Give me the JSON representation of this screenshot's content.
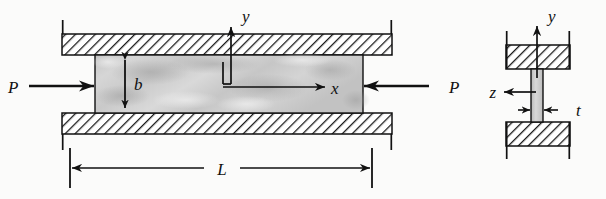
{
  "figure": {
    "colors": {
      "line": "#111111",
      "hatch": "#1a1a1a",
      "specimen_fill": "#cfcfcf",
      "background": "#fbfbfa"
    },
    "side_view": {
      "load_left": {
        "label": "P",
        "arrow_direction": "right"
      },
      "load_right": {
        "label": "P",
        "arrow_direction": "left"
      },
      "axes": {
        "vertical": {
          "label": "y",
          "direction": "up"
        },
        "horizontal": {
          "label": "x",
          "direction": "right"
        }
      },
      "dimensions": [
        {
          "label": "b",
          "orientation": "vertical",
          "description": "plate depth"
        },
        {
          "label": "L",
          "orientation": "horizontal",
          "description": "plate length"
        }
      ],
      "supports": [
        {
          "name": "upper-support",
          "style": "hatched"
        },
        {
          "name": "lower-support",
          "style": "hatched"
        }
      ]
    },
    "cross_section": {
      "axes": {
        "vertical": {
          "label": "y",
          "direction": "up"
        },
        "horizontal": {
          "label": "z",
          "direction": "left"
        }
      },
      "dimensions": [
        {
          "label": "t",
          "orientation": "horizontal",
          "description": "plate thickness"
        }
      ],
      "supports": [
        {
          "name": "upper-support",
          "style": "hatched"
        },
        {
          "name": "lower-support",
          "style": "hatched"
        }
      ]
    }
  }
}
